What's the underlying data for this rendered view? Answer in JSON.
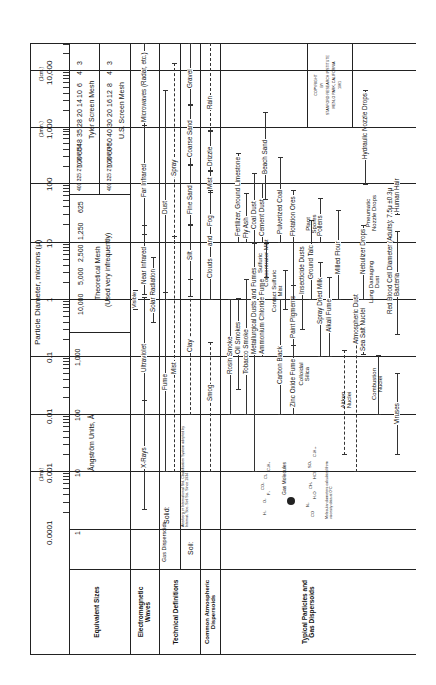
{
  "document": {
    "title": "Particle Diameter, microns (μ)",
    "orientation": "rotated 90 degrees counter-clockwise",
    "copyright": [
      "COPYRIGHT",
      "BY",
      "STANFORD RESEARCH INSTITUTE",
      "MENLO PARK, CALIFORNIA",
      "1961"
    ]
  },
  "axis": {
    "micron_ticks": [
      "0.0001",
      "0.001",
      "0.01",
      "0.1",
      "1",
      "10",
      "100",
      "1,000",
      "10,000"
    ],
    "unit_notes": {
      "mmu": "(1mμ)",
      "mm": "(1mm.)",
      "cm": "(1cm.)"
    },
    "angstrom": {
      "label": "Ångström Units, Å",
      "ticks": [
        "1",
        "10",
        "100",
        "1,000"
      ]
    },
    "theoretical_mesh": {
      "label": "Theoretical Mesh",
      "note": "(Used very infrequently)",
      "ticks": [
        "10,000",
        "5,000",
        "2,500",
        "1,250",
        "625"
      ]
    },
    "tyler_mesh": {
      "label": "Tyler Screen Mesh",
      "ticks": [
        "400",
        "325",
        "270",
        "200",
        "150",
        "100",
        "65",
        "48",
        "35",
        "28",
        "20",
        "14",
        "10",
        "6",
        "4",
        "3",
        "2½",
        "1½",
        "1″"
      ]
    },
    "us_mesh": {
      "label": "U.S. Screen Mesh",
      "ticks": [
        "400",
        "325",
        "270",
        "200",
        "140",
        "100",
        "60",
        "50",
        "40",
        "30",
        "20",
        "16",
        "12",
        "8",
        "6",
        "4",
        "3",
        "2½",
        "1½",
        "1″"
      ]
    }
  },
  "row_headers": {
    "equivalent_sizes": "Equivalent Sizes",
    "electromagnetic_waves": "Electromagnetic Waves",
    "technical_definitions": "Technical Definitions",
    "common_atmospheric": "Common Atmospheric Dispersoids",
    "typical_particles": "Typical Particles and Gas Dispersoids"
  },
  "electromagnetic": [
    "X-Rays",
    "Ultraviolet",
    "Visible",
    "Near Infrared",
    "Solar Radiation",
    "Far Infrared",
    "Microwaves (Radar, etc.)"
  ],
  "technical": {
    "gas_dispersoids": "Gas Dispersoids",
    "solid": "Solid:",
    "liquid_fume": "Fume",
    "dust": "Dust",
    "mist": "Mist",
    "spray": "Spray",
    "soil": "Soil:",
    "soil_note": "Atterberg or International Std. Classification System adopted by Internat. Soc. Soil Sci. Since 1934",
    "soil_classes": [
      "Clay",
      "Silt",
      "Fine Sand",
      "Coarse Sand",
      "Gravel"
    ]
  },
  "atmospheric": [
    "Smog",
    "Clouds",
    "and",
    "Fog",
    "Mist",
    "Drizzle",
    "Rain"
  ],
  "particles": [
    "Rosin Smoke",
    "Oil Smokes",
    "Tobacco Smoke",
    "Metallurgical Dusts and Fumes",
    "Ammonium Chloride Fume",
    "Sulfuric Concentrator Mist",
    "Cement Dust",
    "Coal Dust",
    "Fly Ash",
    "Fertilizer, Ground Limestone",
    "Carbon Black",
    "Contact Sulfuric Mist",
    "Pulverized Coal",
    "Zinc Oxide Fume",
    "Colloidal Silica",
    "Paint Pigments",
    "Flotation Ores",
    "Insecticide Dusts",
    "Ground Talc",
    "Plant Spores",
    "Spray Dried Milk",
    "Pollens",
    "Alkali Fume",
    "Milled Flour",
    "Aitken Nuclei",
    "Atmospheric Dust",
    "Sea Salt Nuclei",
    "Nebulizer Drops",
    "Lung Damaging Dust",
    "Pneumatic Nozzle Drops",
    "Hydraulic Nozzle Drops",
    "Combustion Nuclei",
    "Red Blood Cell Diameter (Adults): 7.5μ ±0.3μ",
    "Viruses",
    "Bacteria",
    "Human Hair",
    "Beach Sand"
  ],
  "gas_molecules": {
    "label": "Gas Molecules",
    "left": [
      "H₂",
      "O₂",
      "F₂",
      "CO₂",
      "Cl₂",
      "C₃H₈"
    ],
    "right": [
      "CO",
      "N₂",
      "H₂O",
      "CH₄",
      "HCl",
      "SO₂",
      "C₄H₁₀"
    ],
    "note": "Molecular diameters calculated from viscosity data at 0°C"
  }
}
